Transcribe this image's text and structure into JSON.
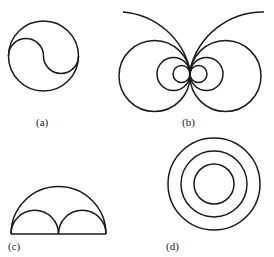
{
  "figure": {
    "panels": [
      {
        "id": "a",
        "label": "(a)",
        "description": "Circle divided by S-shaped curve of two semicircles"
      },
      {
        "id": "b",
        "label": "(b)",
        "description": "Families of circles tangent at a common point, with two large arcs above"
      },
      {
        "id": "c",
        "label": "(c)",
        "description": "Large semicircle containing two smaller adjacent semicircles on a common baseline"
      },
      {
        "id": "d",
        "label": "(d)",
        "description": "Three concentric circles"
      }
    ],
    "colors": {
      "stroke": "#1a1a1a",
      "background": "#ffffff",
      "text": "#222222"
    }
  }
}
